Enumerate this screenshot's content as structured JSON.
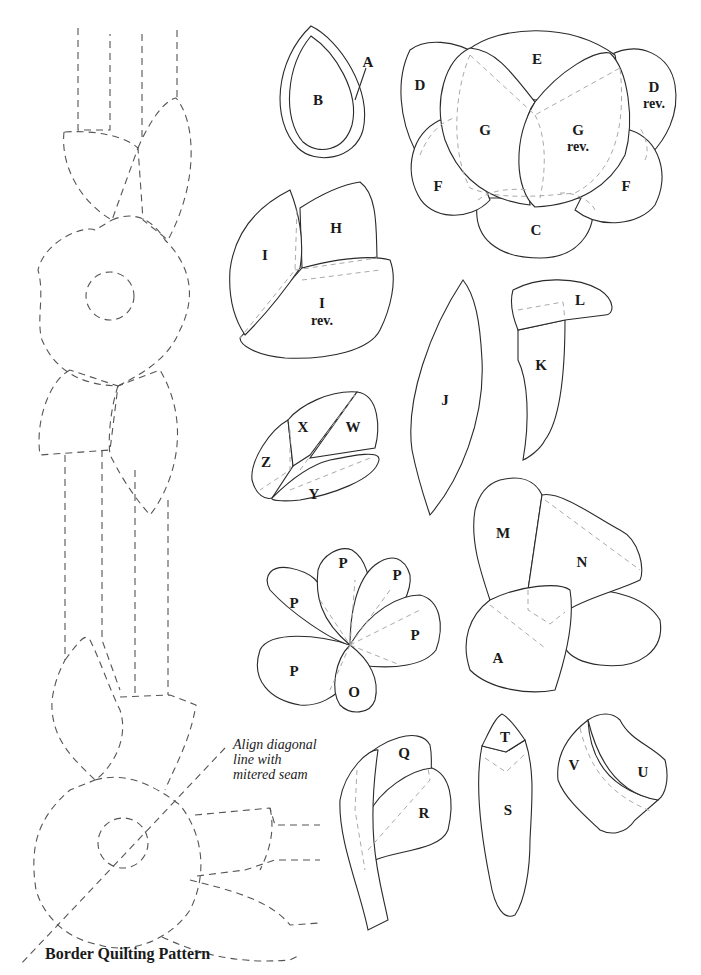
{
  "title": "Border Quilting Pattern",
  "annotation": "Align diagonal\nline with\nmitered seam",
  "legend": {
    "solid_line": "appliqué template outline",
    "dashed_line": "quilting line",
    "gray_dashed_line": "underlap / seam allowance"
  },
  "pieces": {
    "A": "A",
    "B": "B",
    "C": "C",
    "D": "D",
    "D_rev": "D",
    "rev": "rev.",
    "E": "E",
    "F": "F",
    "G": "G",
    "H": "H",
    "I": "I",
    "J": "J",
    "K": "K",
    "L": "L",
    "M": "M",
    "N": "N",
    "O": "O",
    "P": "P",
    "Q": "Q",
    "R": "R",
    "S": "S",
    "T": "T",
    "U": "U",
    "V": "V",
    "W": "W",
    "X": "X",
    "Y": "Y",
    "Z": "Z"
  },
  "groups": [
    {
      "name": "teardrop",
      "labels": [
        "A",
        "B"
      ]
    },
    {
      "name": "large-flower",
      "labels": [
        "C",
        "D",
        "D rev.",
        "E",
        "F",
        "F",
        "G",
        "G rev."
      ]
    },
    {
      "name": "bud-hi",
      "labels": [
        "H",
        "I",
        "I rev."
      ]
    },
    {
      "name": "leaf-j",
      "labels": [
        "J"
      ]
    },
    {
      "name": "stem-kl",
      "labels": [
        "K",
        "L"
      ]
    },
    {
      "name": "bud-wxyz",
      "labels": [
        "W",
        "X",
        "Y",
        "Z"
      ]
    },
    {
      "name": "flower-mna",
      "labels": [
        "M",
        "N",
        "A"
      ]
    },
    {
      "name": "petal-flower",
      "labels": [
        "P",
        "P",
        "P",
        "P",
        "P",
        "O"
      ]
    },
    {
      "name": "stem-qr",
      "labels": [
        "Q",
        "R"
      ]
    },
    {
      "name": "bud-st",
      "labels": [
        "S",
        "T"
      ]
    },
    {
      "name": "bud-uv",
      "labels": [
        "U",
        "V"
      ]
    }
  ]
}
